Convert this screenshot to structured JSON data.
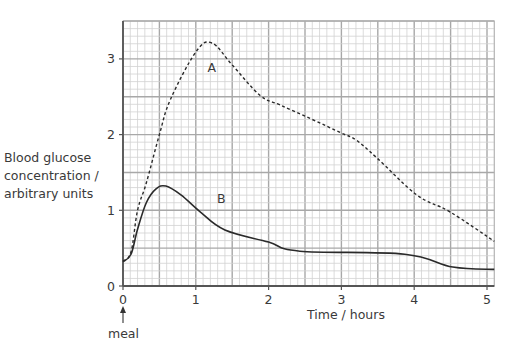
{
  "chart_data": {
    "type": "line",
    "title": "",
    "xlabel": "Time / hours",
    "ylabel": [
      "Blood glucose",
      "concentration /",
      "arbitrary units"
    ],
    "xlim": [
      0,
      5.1
    ],
    "ylim": [
      0,
      3.5
    ],
    "x_ticks": [
      "0",
      "1",
      "2",
      "3",
      "4",
      "5"
    ],
    "y_ticks": [
      "0",
      "1",
      "2",
      "3"
    ],
    "grid": true,
    "annotation": "meal",
    "annotation_x": 0,
    "series": [
      {
        "name": "A",
        "style": "dashed",
        "label_pos": [
          1.22,
          2.83
        ],
        "points": [
          [
            0,
            0.33
          ],
          [
            0.11,
            0.45
          ],
          [
            0.2,
            1.0
          ],
          [
            0.32,
            1.36
          ],
          [
            0.5,
            2.0
          ],
          [
            0.65,
            2.46
          ],
          [
            1.0,
            3.09
          ],
          [
            1.22,
            3.21
          ],
          [
            1.5,
            2.92
          ],
          [
            1.88,
            2.52
          ],
          [
            2.16,
            2.39
          ],
          [
            2.6,
            2.2
          ],
          [
            3.0,
            2.02
          ],
          [
            3.2,
            1.93
          ],
          [
            3.49,
            1.69
          ],
          [
            4.04,
            1.2
          ],
          [
            4.49,
            0.98
          ],
          [
            5.1,
            0.59
          ]
        ]
      },
      {
        "name": "B",
        "style": "solid",
        "label_pos": [
          1.35,
          1.1
        ],
        "points": [
          [
            0,
            0.32
          ],
          [
            0.11,
            0.42
          ],
          [
            0.2,
            0.75
          ],
          [
            0.32,
            1.1
          ],
          [
            0.45,
            1.28
          ],
          [
            0.59,
            1.32
          ],
          [
            0.8,
            1.2
          ],
          [
            1.06,
            0.98
          ],
          [
            1.4,
            0.74
          ],
          [
            2.0,
            0.58
          ],
          [
            2.43,
            0.46
          ],
          [
            3.87,
            0.42
          ],
          [
            4.53,
            0.25
          ],
          [
            5.1,
            0.22
          ]
        ]
      }
    ]
  }
}
